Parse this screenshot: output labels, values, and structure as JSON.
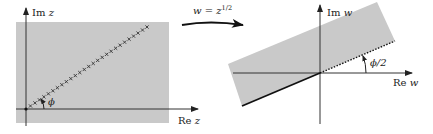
{
  "left_panel": {
    "im_label": "Im",
    "im_var": "z",
    "re_label": "Re",
    "re_var": "z",
    "angle_label": "ϕ",
    "region_color": "#c9c9c9",
    "ray_marker": "×"
  },
  "mapping": {
    "label_lhs": "w",
    "label_eq": " = ",
    "label_base": "z",
    "label_exp": "1/2"
  },
  "right_panel": {
    "im_label": "Im",
    "im_var": "w",
    "re_label": "Re",
    "re_var": "w",
    "angle_label": "ϕ/2",
    "region_color": "#c9c9c9"
  }
}
